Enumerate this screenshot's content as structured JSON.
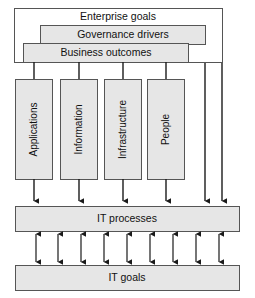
{
  "diagram": {
    "colors": {
      "box_fill": "#e6e6e6",
      "box_stroke": "#555555",
      "open_box_fill": "#ffffff",
      "arrow": "#1a1a1a",
      "text": "#111111",
      "background": "#ffffff"
    },
    "top_layers": [
      {
        "id": "enterprise-goals",
        "label": "Enterprise goals",
        "filled": false
      },
      {
        "id": "governance-drivers",
        "label": "Governance drivers",
        "filled": true
      },
      {
        "id": "business-outcomes",
        "label": "Business outcomes",
        "filled": true
      }
    ],
    "resource_columns": [
      {
        "id": "applications",
        "label": "Applications"
      },
      {
        "id": "information",
        "label": "Information"
      },
      {
        "id": "infrastructure",
        "label": "Infrastructure"
      },
      {
        "id": "people",
        "label": "People"
      }
    ],
    "process_layer": {
      "id": "it-processes",
      "label": "IT processes"
    },
    "goal_layer": {
      "id": "it-goals",
      "label": "IT goals"
    },
    "connectors": {
      "downward_into_processes": 6,
      "bidirectional_processes_to_goals": 9
    }
  }
}
